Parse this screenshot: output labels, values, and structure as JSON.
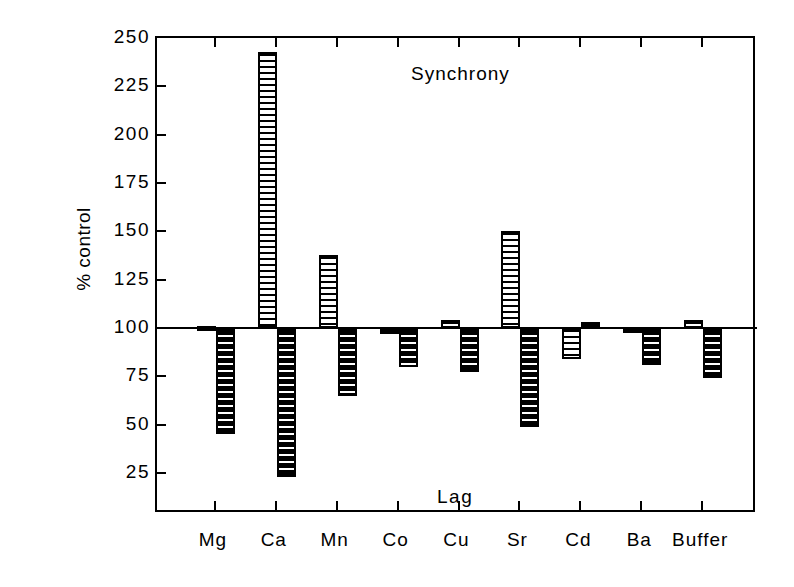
{
  "chart_data": {
    "type": "bar",
    "title": "",
    "annotations": [
      {
        "text": "Synchrony",
        "x_frac": 0.5,
        "y_value": 232
      },
      {
        "text": "Lag",
        "x_frac": 0.5,
        "y_value": 13
      }
    ],
    "xlabel": "",
    "ylabel": "% control",
    "ylim": [
      12,
      250
    ],
    "yticks": [
      250,
      225,
      200,
      175,
      150,
      125,
      100,
      75,
      50,
      25
    ],
    "ytick_labels": [
      "250",
      "225",
      "200",
      "175",
      "150",
      "125",
      "100",
      "75",
      "50",
      "25"
    ],
    "baseline": 100,
    "grid": false,
    "legend": "none",
    "categories": [
      "Mg",
      "Ca",
      "Mn",
      "Co",
      "Cu",
      "Sr",
      "Cd",
      "Ba",
      "Buffer"
    ],
    "series": [
      {
        "name": "Synchrony",
        "pattern": "light-horizontal-hatch",
        "values": [
          101,
          243,
          138,
          97,
          104,
          150,
          84,
          100,
          104
        ]
      },
      {
        "name": "Lag",
        "pattern": "dark-horizontal-hatch",
        "values": [
          45,
          23,
          65,
          80,
          77,
          49,
          103,
          81,
          74
        ]
      }
    ]
  },
  "axes": {
    "ylabel": "% control",
    "ytick_labels": [
      "250",
      "225",
      "200",
      "175",
      "150",
      "125",
      "100",
      "75",
      "50",
      "25"
    ],
    "xtick_labels": [
      "Mg",
      "Ca",
      "Mn",
      "Co",
      "Cu",
      "Sr",
      "Cd",
      "Ba",
      "Buffer"
    ]
  },
  "labels": {
    "synchrony": "Synchrony",
    "lag": "Lag"
  },
  "colors": {
    "axis": "#000000",
    "bar_light_fill": "#ffffff",
    "bar_light_rule": "#000000",
    "bar_dark_fill": "#111111",
    "bar_dark_rule": "#000000",
    "background": "#ffffff"
  }
}
